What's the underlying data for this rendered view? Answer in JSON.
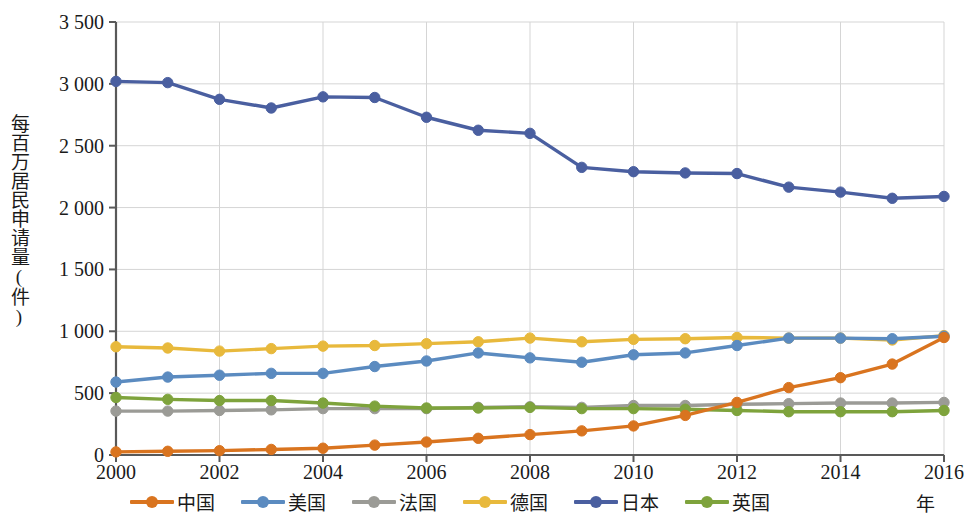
{
  "chart_data": {
    "type": "line",
    "title": "",
    "xlabel": "年",
    "ylabel": "每百万居民申请量(件)",
    "x": [
      2000,
      2001,
      2002,
      2003,
      2004,
      2005,
      2006,
      2007,
      2008,
      2009,
      2010,
      2011,
      2012,
      2013,
      2014,
      2015,
      2016
    ],
    "xtick_labels": [
      "2000",
      "2002",
      "2004",
      "2006",
      "2008",
      "2010",
      "2012",
      "2014",
      "2016"
    ],
    "xticks": [
      2000,
      2002,
      2004,
      2006,
      2008,
      2010,
      2012,
      2014,
      2016
    ],
    "ytick_labels": [
      "0",
      "500",
      "1 000",
      "1 500",
      "2 000",
      "2 500",
      "3 000",
      "3 500"
    ],
    "yticks": [
      0,
      500,
      1000,
      1500,
      2000,
      2500,
      3000,
      3500
    ],
    "ylim": [
      0,
      3500
    ],
    "xlim": [
      2000,
      2016
    ],
    "grid": true,
    "legend_position": "bottom",
    "series": [
      {
        "name": "中国",
        "color": "#D9741F",
        "values": [
          25,
          30,
          35,
          45,
          55,
          80,
          105,
          135,
          165,
          195,
          235,
          320,
          425,
          545,
          625,
          735,
          950
        ]
      },
      {
        "name": "美国",
        "color": "#5B8BC0",
        "values": [
          590,
          630,
          645,
          660,
          660,
          715,
          760,
          825,
          785,
          750,
          810,
          825,
          885,
          945,
          945,
          940,
          960
        ]
      },
      {
        "name": "法国",
        "color": "#9B9B96",
        "values": [
          355,
          355,
          360,
          365,
          375,
          375,
          375,
          385,
          390,
          385,
          400,
          400,
          410,
          415,
          420,
          420,
          425
        ]
      },
      {
        "name": "德国",
        "color": "#E8B93C",
        "values": [
          875,
          865,
          840,
          860,
          880,
          885,
          900,
          915,
          945,
          915,
          935,
          940,
          950,
          945,
          945,
          930,
          965
        ]
      },
      {
        "name": "日本",
        "color": "#4A5FA0",
        "values": [
          3020,
          3010,
          2875,
          2805,
          2895,
          2890,
          2730,
          2625,
          2600,
          2325,
          2290,
          2280,
          2275,
          2165,
          2125,
          2075,
          2090
        ]
      },
      {
        "name": "英国",
        "color": "#7EA33C",
        "values": [
          465,
          450,
          440,
          440,
          420,
          395,
          380,
          380,
          385,
          375,
          375,
          370,
          360,
          350,
          350,
          350,
          360
        ]
      }
    ]
  }
}
